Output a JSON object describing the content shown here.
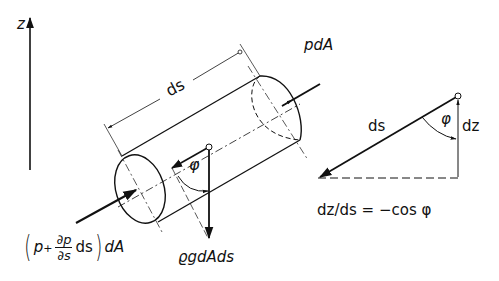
{
  "figure": {
    "axis": {
      "label": "z"
    },
    "cylinder": {
      "length_label": "ds",
      "force_front": "pdA",
      "force_back": {
        "open": "(",
        "p": "p",
        "plus": "+",
        "num": "∂p",
        "den": "∂s",
        "ds": "ds",
        "close": ")",
        "dA": "dA"
      },
      "weight": "ϱgdAds",
      "angle": "φ"
    },
    "triangle": {
      "hyp_label": "ds",
      "angle_label": "φ",
      "vert_label": "dz",
      "relation": "dz/ds = −cos φ"
    }
  }
}
